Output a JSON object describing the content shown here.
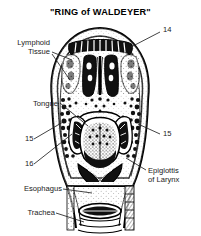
{
  "figure": {
    "title": "\"RING of WALDEYER\"",
    "style": "black-and-white line drawing / halftone anatomical illustration",
    "background_color": "#ffffff",
    "ink_color": "#000000"
  },
  "labels": {
    "lymphoid_tissue_line1": "Lymphoid",
    "lymphoid_tissue_line2": "Tissue",
    "tongue": "Tongue",
    "esophagus": "Esophagus",
    "trachea": "Trachea",
    "epiglottis_line1": "Epiglottis",
    "epiglottis_line2": "of Larynx",
    "num_14": "14",
    "num_15_left": "15",
    "num_16": "16",
    "num_15_right": "15"
  }
}
